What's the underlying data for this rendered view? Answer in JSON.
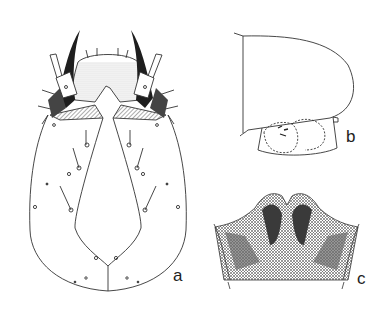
{
  "figure": {
    "type": "scientific-line-illustration",
    "panels": [
      {
        "id": "a",
        "label": "a",
        "description": "larval head capsule, dorsal view"
      },
      {
        "id": "b",
        "label": "b",
        "description": "head, lateral view"
      },
      {
        "id": "c",
        "label": "c",
        "description": "mouthpart structure, stippled"
      }
    ]
  },
  "colors": {
    "line": "#333333",
    "background": "#ffffff",
    "dark": "#1e1e1e",
    "shade": "#777777"
  }
}
